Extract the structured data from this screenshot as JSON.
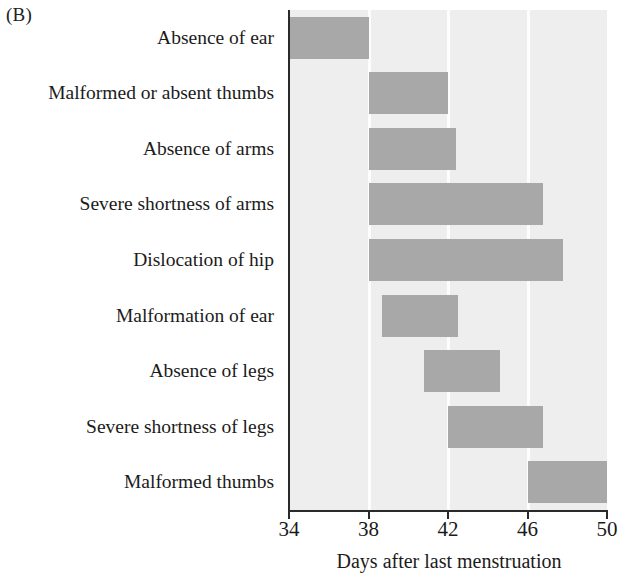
{
  "panel": {
    "letter": "(B)"
  },
  "chart_data": {
    "type": "bar",
    "orientation": "horizontal",
    "subtype": "range-bar",
    "title": "",
    "xlabel": "Days after last menstruation",
    "ylabel": "",
    "xlim": [
      34,
      50
    ],
    "xticks": [
      34,
      38,
      42,
      46,
      50
    ],
    "xtick_labels": [
      "34",
      "38",
      "42",
      "46",
      "50"
    ],
    "grid": "vertical-white",
    "legend": "none",
    "plot_background": "#eeeeee",
    "bar_color": "#a8a8a8",
    "categories": [
      "Absence of ear",
      "Malformed or absent thumbs",
      "Absence of arms",
      "Severe shortness of arms",
      "Dislocation of hip",
      "Malformation of ear",
      "Absence of legs",
      "Severe shortness of legs",
      "Malformed thumbs"
    ],
    "bars": [
      {
        "label": "Absence of ear",
        "start": 34.0,
        "end": 38.0
      },
      {
        "label": "Malformed or absent thumbs",
        "start": 38.0,
        "end": 42.0
      },
      {
        "label": "Absence of arms",
        "start": 38.0,
        "end": 42.4
      },
      {
        "label": "Severe shortness of arms",
        "start": 38.0,
        "end": 46.8
      },
      {
        "label": "Dislocation of hip",
        "start": 38.0,
        "end": 47.8
      },
      {
        "label": "Malformation of ear",
        "start": 38.7,
        "end": 42.5
      },
      {
        "label": "Absence of legs",
        "start": 40.8,
        "end": 44.6
      },
      {
        "label": "Severe shortness of legs",
        "start": 42.0,
        "end": 46.8
      },
      {
        "label": "Malformed thumbs",
        "start": 46.0,
        "end": 50.0
      }
    ]
  }
}
